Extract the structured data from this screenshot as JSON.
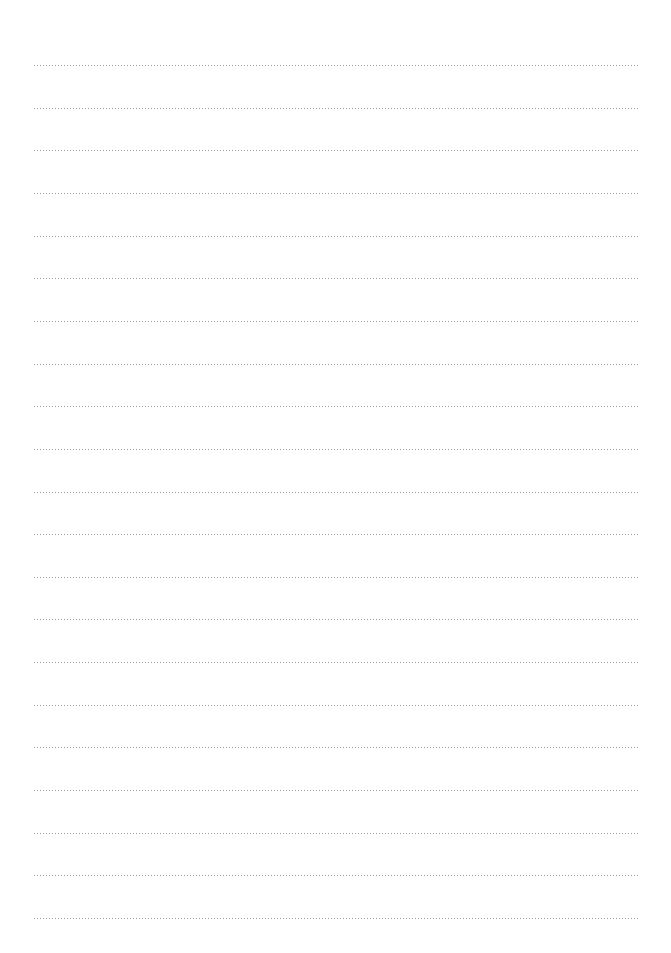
{
  "page": {
    "type": "blank-lined-paper",
    "line_style": "dotted",
    "line_color": "#8a8a8a",
    "background_color": "#ffffff",
    "line_count": 21,
    "first_line_y": 65,
    "line_spacing": 42.65,
    "line_left": 33,
    "line_right": 639
  }
}
